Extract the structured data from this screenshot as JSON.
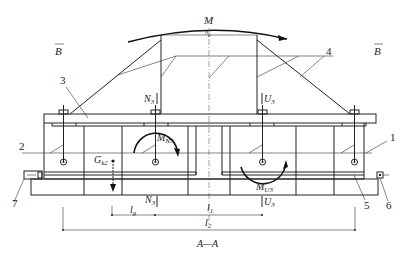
{
  "diagram": {
    "caption": "A—A",
    "moment_label": "M",
    "section_marks": {
      "left": "B",
      "right": "B"
    },
    "part_labels": {
      "p1": "1",
      "p2": "2",
      "p3": "3",
      "p4": "4",
      "p5": "5",
      "p6": "6",
      "p7": "7"
    },
    "forces": {
      "N3_top": {
        "main": "N",
        "sub": "3"
      },
      "U3_top": {
        "main": "U",
        "sub": "3"
      },
      "N3_bottom": {
        "main": "N",
        "sub": "3"
      },
      "U3_bottom": {
        "main": "U",
        "sub": "3"
      },
      "MN3": {
        "main": "M",
        "sub": "N3"
      },
      "MU3": {
        "main": "M",
        "sub": "U3"
      },
      "Gk2": {
        "main": "G",
        "sub": "k2"
      }
    },
    "dimensions": {
      "lg": {
        "main": "l",
        "sub": "g"
      },
      "l1": {
        "main": "l",
        "sub": "1"
      },
      "l2": {
        "main": "l",
        "sub": "2"
      }
    }
  }
}
